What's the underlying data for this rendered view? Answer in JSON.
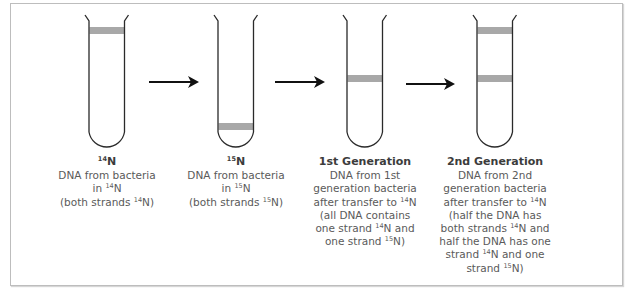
{
  "diagram": {
    "type": "Meselson-Stahl DNA replication experiment",
    "tubes": [
      {
        "id": "tube-14n",
        "title_iso": "14",
        "title_rest": "N",
        "bands": [
          "top"
        ],
        "lines": [
          {
            "parts": [
              {
                "t": "DNA from bacteria"
              }
            ]
          },
          {
            "parts": [
              {
                "t": "in "
              },
              {
                "sup": "14"
              },
              {
                "t": "N"
              }
            ]
          },
          {
            "parts": [
              {
                "t": "(both strands "
              },
              {
                "sup": "14"
              },
              {
                "t": "N)"
              }
            ]
          }
        ]
      },
      {
        "id": "tube-15n",
        "title_iso": "15",
        "title_rest": "N",
        "bands": [
          "bottom"
        ],
        "lines": [
          {
            "parts": [
              {
                "t": "DNA from bacteria"
              }
            ]
          },
          {
            "parts": [
              {
                "t": "in "
              },
              {
                "sup": "15"
              },
              {
                "t": "N"
              }
            ]
          },
          {
            "parts": [
              {
                "t": "(both strands "
              },
              {
                "sup": "15"
              },
              {
                "t": "N)"
              }
            ]
          }
        ]
      },
      {
        "id": "tube-1st-gen",
        "title": "1st Generation",
        "bands": [
          "middle"
        ],
        "lines": [
          {
            "parts": [
              {
                "t": "DNA from 1st"
              }
            ]
          },
          {
            "parts": [
              {
                "t": "generation bacteria"
              }
            ]
          },
          {
            "parts": [
              {
                "t": "after transfer to "
              },
              {
                "sup": "14"
              },
              {
                "t": "N"
              }
            ]
          },
          {
            "parts": [
              {
                "t": "(all DNA contains"
              }
            ]
          },
          {
            "parts": [
              {
                "t": "one strand "
              },
              {
                "sup": "14"
              },
              {
                "t": "N and"
              }
            ]
          },
          {
            "parts": [
              {
                "t": "one strand "
              },
              {
                "sup": "15"
              },
              {
                "t": "N)"
              }
            ]
          }
        ]
      },
      {
        "id": "tube-2nd-gen",
        "title": "2nd Generation",
        "bands": [
          "top",
          "middle"
        ],
        "lines": [
          {
            "parts": [
              {
                "t": "DNA from 2nd"
              }
            ]
          },
          {
            "parts": [
              {
                "t": "generation bacteria"
              }
            ]
          },
          {
            "parts": [
              {
                "t": "after transfer to "
              },
              {
                "sup": "14"
              },
              {
                "t": "N"
              }
            ]
          },
          {
            "parts": [
              {
                "t": "(half the DNA has"
              }
            ]
          },
          {
            "parts": [
              {
                "t": "both strands "
              },
              {
                "sup": "14"
              },
              {
                "t": "N and"
              }
            ]
          },
          {
            "parts": [
              {
                "t": "half the DNA has one"
              }
            ]
          },
          {
            "parts": [
              {
                "t": "strand "
              },
              {
                "sup": "14"
              },
              {
                "t": "N and one"
              }
            ]
          },
          {
            "parts": [
              {
                "t": "strand "
              },
              {
                "sup": "15"
              },
              {
                "t": "N)"
              }
            ]
          }
        ]
      }
    ],
    "arrows": 3,
    "colors": {
      "tube_outline": "#2a2a2a",
      "band": "#a8a8a8",
      "arrow": "#111111",
      "text": "#5a5a5a",
      "title": "#3c3c3c",
      "frame": "#bdbdbd"
    }
  }
}
